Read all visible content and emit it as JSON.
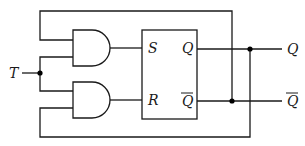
{
  "diagram": {
    "type": "T flip-flop built from SR flip-flop with AND gates",
    "input": {
      "label": "T"
    },
    "gates": [
      {
        "id": "and-upper",
        "type": "AND",
        "output_to": "S"
      },
      {
        "id": "and-lower",
        "type": "AND",
        "output_to": "R"
      }
    ],
    "flipflop": {
      "inputs": {
        "set": "S",
        "reset": "R"
      },
      "outputs": {
        "q": "Q",
        "q_bar": "Q"
      }
    },
    "outputs": {
      "q": "Q",
      "q_bar": "Q"
    },
    "feedback": [
      {
        "from": "Q-bar",
        "to": "and-upper input 1"
      },
      {
        "from": "Q",
        "to": "and-lower input 2"
      }
    ]
  }
}
